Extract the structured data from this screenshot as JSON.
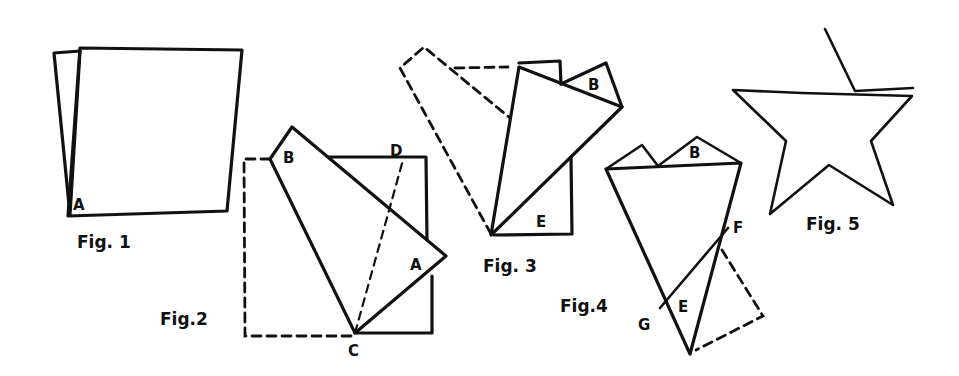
{
  "figures": [
    {
      "id": "fig1",
      "caption": "Fig. 1",
      "points": [
        "A"
      ],
      "description": "Square sheet of paper with one corner slightly fanned to show two layers"
    },
    {
      "id": "fig2",
      "caption": "Fig.2",
      "points": [
        "B",
        "D",
        "A",
        "C"
      ],
      "description": "Folded layer rotated about C; dashed outline shows original position; dashed fold line C to D"
    },
    {
      "id": "fig3",
      "caption": "Fig. 3",
      "points": [
        "B",
        "E"
      ],
      "description": "Second fold; dashed outline shows previous position"
    },
    {
      "id": "fig4",
      "caption": "Fig.4",
      "points": [
        "B",
        "F",
        "E",
        "G"
      ],
      "description": "Kite-shaped folded form with cut line G to F; dashed triangle shows folded flap"
    },
    {
      "id": "fig5",
      "caption": "Fig. 5",
      "points": [],
      "description": "Resulting five-pointed star"
    }
  ],
  "colors": {
    "ink": "#111111",
    "paper": "#ffffff"
  }
}
